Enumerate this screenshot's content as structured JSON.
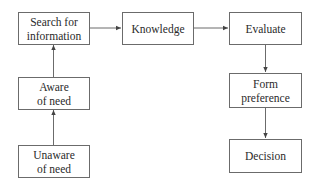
{
  "diagram": {
    "type": "flowchart",
    "nodes": [
      {
        "id": "unaware",
        "label": "Unaware\nof need"
      },
      {
        "id": "aware",
        "label": "Aware\nof need"
      },
      {
        "id": "search",
        "label": "Search for\ninformation"
      },
      {
        "id": "knowledge",
        "label": "Knowledge"
      },
      {
        "id": "evaluate",
        "label": "Evaluate"
      },
      {
        "id": "form",
        "label": "Form\npreference"
      },
      {
        "id": "decision",
        "label": "Decision"
      }
    ],
    "edges": [
      {
        "from": "unaware",
        "to": "aware"
      },
      {
        "from": "aware",
        "to": "search"
      },
      {
        "from": "search",
        "to": "knowledge"
      },
      {
        "from": "knowledge",
        "to": "evaluate"
      },
      {
        "from": "evaluate",
        "to": "form"
      },
      {
        "from": "form",
        "to": "decision"
      }
    ],
    "colors": {
      "stroke": "#6b6b6b",
      "text": "#2a2a2a",
      "background": "#ffffff"
    }
  }
}
